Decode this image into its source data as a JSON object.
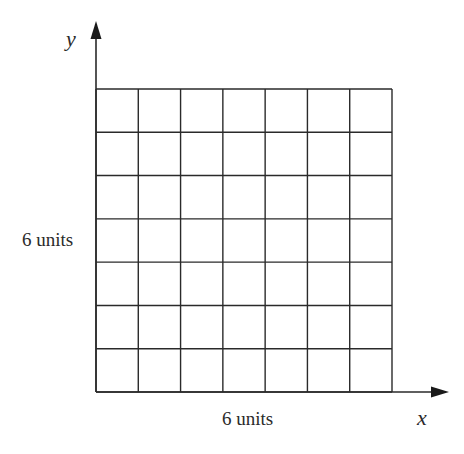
{
  "diagram": {
    "type": "square grid on coordinate axes",
    "axes": {
      "x_label": "x",
      "y_label": "y"
    },
    "grid": {
      "rows": 7,
      "cols": 7,
      "origin_px": [
        96,
        392
      ],
      "right_px": 392,
      "top_px": 89
    },
    "dimension_labels": {
      "bottom": "6 units",
      "left": "6 units"
    },
    "colors": {
      "line": "#2a2a2a",
      "background": "#ffffff"
    }
  }
}
